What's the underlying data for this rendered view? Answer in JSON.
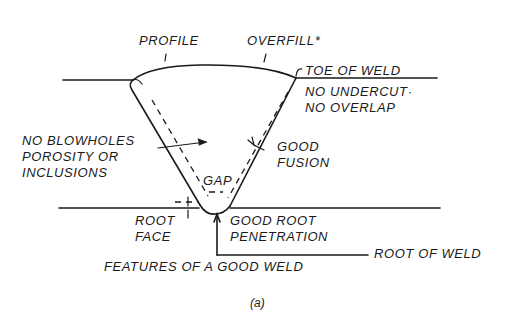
{
  "diagram": {
    "title": "FEATURES OF A GOOD WELD",
    "subfigure": "(a)",
    "colors": {
      "ink": "#1a1a1a",
      "background": "#ffffff"
    },
    "labels": {
      "profile": "PROFILE",
      "overfill": "OVERFILL*",
      "toe_of_weld": "TOE OF WELD",
      "no_undercut": "NO UNDERCUT·",
      "no_overlap": "NO OVERLAP",
      "no_blowholes_1": "NO BLOWHOLES",
      "no_blowholes_2": "POROSITY OR",
      "no_blowholes_3": "INCLUSIONS",
      "good_fusion_1": "GOOD",
      "good_fusion_2": "FUSION",
      "gap": "GAP",
      "root_face_1": "ROOT",
      "root_face_2": "FACE",
      "good_root_penetration_1": "GOOD ROOT",
      "good_root_penetration_2": "PENETRATION",
      "root_of_weld": "ROOT OF WELD"
    }
  }
}
